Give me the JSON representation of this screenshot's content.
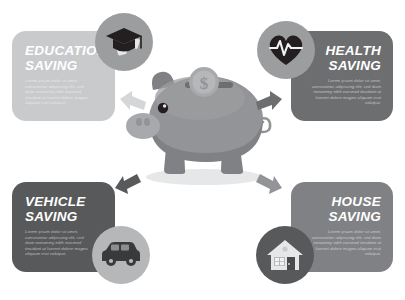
{
  "meta": {
    "background_color": "#ffffff"
  },
  "center": {
    "piggy_bank": {
      "icon": "piggy-bank",
      "body_color": "#929497",
      "shade_color": "#808184",
      "highlight_color": "#a7a9ac",
      "slot_color": "#6d6e70"
    },
    "coin": {
      "icon": "dollar-coin",
      "symbol": "$",
      "color": "#b6b7b9"
    }
  },
  "cards": [
    {
      "id": "education",
      "title": "EDUCATION\nSAVING",
      "body": "Lorem ipsum dolor sit amet, consectetur adipiscing elit, sed diam nonummy nibh euismod tincidunt ut laoreet dolore magna aliquam erat volutpat.",
      "background_color": "#c9cacb",
      "icon": "graduation-cap-icon",
      "icon_badge_color": "#9c9d9f",
      "align": "left"
    },
    {
      "id": "health",
      "title": "HEALTH\nSAVING",
      "body": "Lorem ipsum dolor sit amet, consectetur adipiscing elit, sed diam nonummy nibh euismod tincidunt ut laoreet dolore magna aliquam erat volutpat.",
      "background_color": "#6d6e70",
      "icon": "heart-pulse-icon",
      "icon_badge_color": "#9c9d9f",
      "align": "right"
    },
    {
      "id": "vehicle",
      "title": "VEHICLE\nSAVING",
      "body": "Lorem ipsum dolor sit amet, consectetur adipiscing elit, sed diam nonummy nibh euismod tincidunt ut laoreet dolore magna aliquam erat volutpat.",
      "background_color": "#58595b",
      "icon": "car-icon",
      "icon_badge_color": "#b6b7b9",
      "align": "left"
    },
    {
      "id": "house",
      "title": "HOUSE\nSAVING",
      "body": "Lorem ipsum dolor sit amet, consectetur adipiscing elit, sed diam nonummy nibh euismod tincidunt ut laoreet dolore magna aliquam erat volutpat.",
      "background_color": "#808184",
      "icon": "house-icon",
      "icon_badge_color": "#58595b",
      "align": "right"
    }
  ],
  "arrows": [
    {
      "id": "education",
      "direction": "up-left",
      "color": "#d5d6d7"
    },
    {
      "id": "health",
      "direction": "up-right",
      "color": "#6d6e70"
    },
    {
      "id": "vehicle",
      "direction": "down-left",
      "color": "#58595b"
    },
    {
      "id": "house",
      "direction": "down-right",
      "color": "#929497"
    }
  ]
}
